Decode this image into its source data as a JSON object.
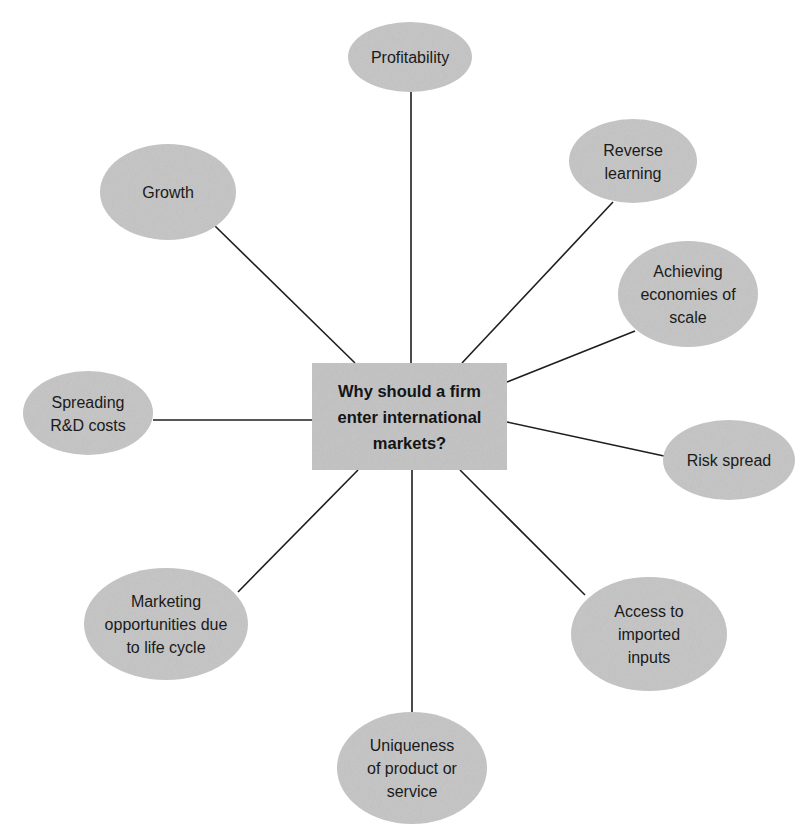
{
  "diagram": {
    "colors": {
      "node_fill": "#c4c4c4",
      "center_fill": "#c2c2c2",
      "line": "#1e1e1e",
      "text": "#1a1a1a",
      "background": "#ffffff"
    },
    "center": {
      "lines": [
        "Why should a firm",
        "enter international",
        "markets?"
      ],
      "box": {
        "x": 312,
        "y": 363,
        "w": 195,
        "h": 107
      }
    },
    "nodes": [
      {
        "id": "profitability",
        "lines": [
          "Profitability"
        ],
        "cx": 410,
        "cy": 57,
        "rx": 62,
        "ry": 35,
        "line": {
          "x1": 411,
          "y1": 92,
          "x2": 411,
          "y2": 363
        }
      },
      {
        "id": "reverse-learning",
        "lines": [
          "Reverse",
          "learning"
        ],
        "cx": 633,
        "cy": 161,
        "rx": 64,
        "ry": 42,
        "line": {
          "x1": 613,
          "y1": 202,
          "x2": 462,
          "y2": 363
        }
      },
      {
        "id": "economies-of-scale",
        "lines": [
          "Achieving",
          "economies of",
          "scale"
        ],
        "cx": 688,
        "cy": 294,
        "rx": 70,
        "ry": 53,
        "line": {
          "x1": 635,
          "y1": 331,
          "x2": 507,
          "y2": 382
        }
      },
      {
        "id": "risk-spread",
        "lines": [
          "Risk spread"
        ],
        "cx": 729,
        "cy": 460,
        "rx": 66,
        "ry": 40,
        "line": {
          "x1": 664,
          "y1": 456,
          "x2": 507,
          "y2": 422
        }
      },
      {
        "id": "access-to-imported-inputs",
        "lines": [
          "Access to",
          "imported",
          "inputs"
        ],
        "cx": 649,
        "cy": 634,
        "rx": 78,
        "ry": 57,
        "line": {
          "x1": 585,
          "y1": 595,
          "x2": 460,
          "y2": 470
        }
      },
      {
        "id": "uniqueness-of-product",
        "lines": [
          "Uniqueness",
          "of product or",
          "service"
        ],
        "cx": 412,
        "cy": 768,
        "rx": 75,
        "ry": 56,
        "line": {
          "x1": 412,
          "y1": 470,
          "x2": 412,
          "y2": 712
        }
      },
      {
        "id": "marketing-opportunities",
        "lines": [
          "Marketing",
          "opportunities due",
          "to life cycle"
        ],
        "cx": 166,
        "cy": 624,
        "rx": 82,
        "ry": 56,
        "line": {
          "x1": 238,
          "y1": 592,
          "x2": 358,
          "y2": 470
        }
      },
      {
        "id": "spreading-rd-costs",
        "lines": [
          "Spreading",
          "R&D costs"
        ],
        "cx": 88,
        "cy": 413,
        "rx": 65,
        "ry": 42,
        "line": {
          "x1": 153,
          "y1": 420,
          "x2": 312,
          "y2": 420
        }
      },
      {
        "id": "growth",
        "lines": [
          "Growth"
        ],
        "cx": 168,
        "cy": 192,
        "rx": 68,
        "ry": 48,
        "line": {
          "x1": 215,
          "y1": 226,
          "x2": 355,
          "y2": 363
        }
      }
    ]
  }
}
